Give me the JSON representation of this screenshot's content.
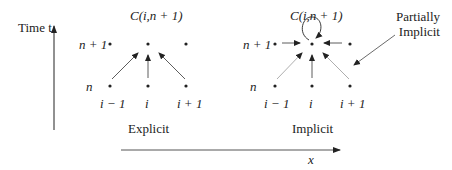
{
  "axes": {
    "time_label": "Time t",
    "x_label": "x"
  },
  "explicit": {
    "title": "C(i,n + 1)",
    "row_top": "n + 1",
    "row_bottom": "n",
    "cols": [
      "i − 1",
      "i",
      "i + 1"
    ],
    "caption": "Explicit"
  },
  "implicit": {
    "title": "C(i,n + 1)",
    "row_top": "n + 1",
    "row_bottom": "n",
    "cols": [
      "i − 1",
      "i",
      "i + 1"
    ],
    "caption": "Implicit"
  },
  "annotation": {
    "line1": "Partially",
    "line2": "Implicit"
  },
  "colors": {
    "ink": "#222222",
    "light_arrow": "#9a9a9a"
  }
}
